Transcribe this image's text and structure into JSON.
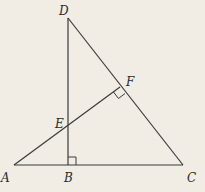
{
  "diagram": {
    "type": "geometry",
    "background": "#f1ede4",
    "line_color": "#3a3a3a",
    "points": {
      "A": {
        "label": "A",
        "x": 14,
        "y": 165
      },
      "B": {
        "label": "B",
        "x": 68,
        "y": 165
      },
      "C": {
        "label": "C",
        "x": 183,
        "y": 165
      },
      "D": {
        "label": "D",
        "x": 68,
        "y": 18
      },
      "E": {
        "label": "E",
        "x": 68,
        "y": 129
      },
      "F": {
        "label": "F",
        "x": 120,
        "y": 87
      }
    },
    "segments": [
      "AC",
      "DB",
      "DC",
      "AF"
    ],
    "right_angles": [
      "DBC at B",
      "AFC at F"
    ]
  }
}
